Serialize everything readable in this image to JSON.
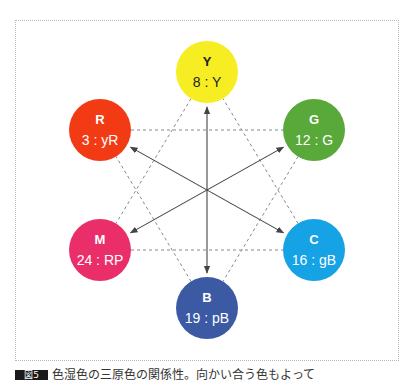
{
  "diagram": {
    "nodes": [
      {
        "id": "Y",
        "symbol": "Y",
        "code": "8 : Y",
        "fill": "#f6ee22",
        "text_color": "#222222",
        "cx": 207,
        "cy": 72
      },
      {
        "id": "R",
        "symbol": "R",
        "code": "3 : yR",
        "fill": "#f23b14",
        "text_color": "#ffffff",
        "cx": 100,
        "cy": 130
      },
      {
        "id": "G",
        "symbol": "G",
        "code": "12 : G",
        "fill": "#58a83a",
        "text_color": "#ffffff",
        "cx": 314,
        "cy": 130
      },
      {
        "id": "M",
        "symbol": "M",
        "code": "24 : RP",
        "fill": "#ea2e6a",
        "text_color": "#ffffff",
        "cx": 100,
        "cy": 250
      },
      {
        "id": "C",
        "symbol": "C",
        "code": "16 : gB",
        "fill": "#15a3e6",
        "text_color": "#ffffff",
        "cx": 314,
        "cy": 250
      },
      {
        "id": "B",
        "symbol": "B",
        "code": "19 : pB",
        "fill": "#3c5aa4",
        "text_color": "#ffffff",
        "cx": 207,
        "cy": 308
      }
    ],
    "complementary_arrows": [
      {
        "from": "Y",
        "to": "B"
      },
      {
        "from": "R",
        "to": "C"
      },
      {
        "from": "G",
        "to": "M"
      }
    ],
    "dashed_triangles": [
      {
        "vertices": [
          "Y",
          "M",
          "C"
        ]
      },
      {
        "vertices": [
          "R",
          "G",
          "B"
        ]
      }
    ],
    "frame_border": "#b8b8b8",
    "line_color": "#444444",
    "dash_color": "#888888"
  },
  "caption": {
    "tag": "図5",
    "text": "色湿色の三原色の関係性。向かい合う色もよって"
  }
}
